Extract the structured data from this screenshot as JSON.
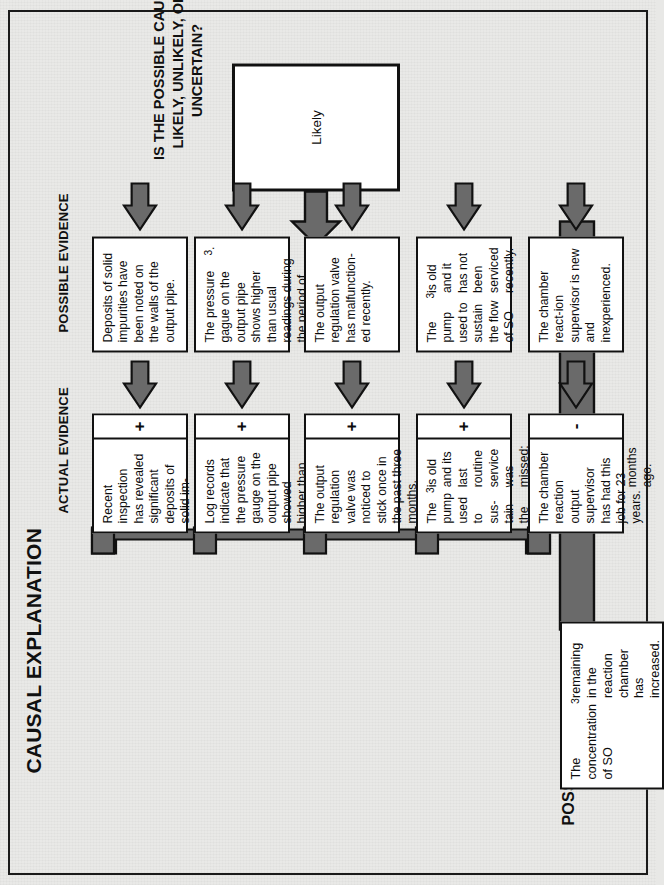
{
  "diagram": {
    "title": "CAUSAL EXPLANATION",
    "question": "IS THE POSSIBLE CAUSE LIKELY, UNLIKELY, OR UNCERTAIN?",
    "conclusion": "Likely",
    "headers": {
      "actual_evidence": "ACTUAL EVIDENCE",
      "possible_evidence": "POSSIBLE EVIDENCE",
      "possible_cause": "POSSIBLE CAUSE"
    },
    "possible_cause_text": "The concentration of SO3 remaining in the reaction chamber has increased.",
    "possible_evidence": [
      {
        "id": 1,
        "text": "Deposits of solid impurities have been noted on the walls of the output pipe."
      },
      {
        "id": 2,
        "text": "The pressure gague on the output pipe shows higher than usual readings during the period of decrease in SO3."
      },
      {
        "id": 3,
        "text": "The output regulation valve has malfunction-ed recently."
      },
      {
        "id": 4,
        "text": "The pump used to sustain the flow of SO3 is old and it has not been serviced recently."
      },
      {
        "id": 5,
        "text": "The chamber react-ion supervisor is new and inexperienced."
      }
    ],
    "actual_evidence": [
      {
        "id": 1,
        "sign": "+",
        "text": "Recent inspection has revealed significant deposits of solid im-purities on the walls of the output pipe."
      },
      {
        "id": 2,
        "sign": "+",
        "text": "Log records indicate that the pressure gauge on the output pipe showed higher than usual readings."
      },
      {
        "id": 3,
        "sign": "+",
        "text": "The output regulation valve was noticed to stick once in the past three months."
      },
      {
        "id": 4,
        "sign": "+",
        "text": "The pump used to sus-tain the flow of SO3 is old and its last routine service was missed; prior to that it was ser-viced 18 months ago."
      },
      {
        "id": 5,
        "sign": "-",
        "text": "The chamber reaction output supervisor has had this job for 23 years."
      }
    ],
    "colors": {
      "ink": "#111111",
      "connector_fill": "#6a6a6a",
      "paper": "#e9e9e7",
      "box_fill": "#ffffff"
    }
  }
}
